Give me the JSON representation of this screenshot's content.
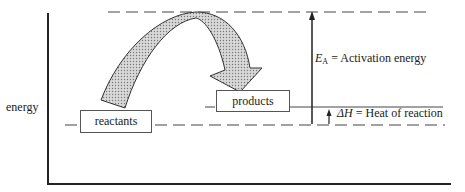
{
  "diagram": {
    "axis_label": "energy",
    "reactants_label": "reactants",
    "products_label": "products",
    "activation": {
      "symbol": "E",
      "subscript": "A",
      "equals": " = ",
      "text": "Activation energy"
    },
    "heat": {
      "symbol": "ΔH",
      "equals": " = ",
      "text": "Heat of reaction"
    }
  }
}
